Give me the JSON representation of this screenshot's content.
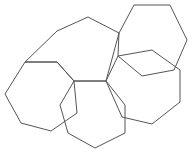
{
  "figure": {
    "name": "overlapping-heptagons-figure",
    "background_color": "#ffffff",
    "width": 195,
    "height": 154,
    "stroke_color": "#555555",
    "stroke_width": 1,
    "fill": "none",
    "shape_count": 5,
    "shape_type": "heptagon"
  },
  "chart_data": {
    "type": "diagram",
    "title": "",
    "subtitle": "",
    "xlabel": "",
    "ylabel": "",
    "grid": false,
    "legend": false,
    "xlim": [
      0,
      195
    ],
    "ylim": [
      0,
      154
    ],
    "series": [
      {
        "name": "heptagon-top-left",
        "label": "Top-left heptagon",
        "closed": true,
        "points": [
          [
            88,
            17
          ],
          [
            119,
            33
          ],
          [
            106,
            81
          ],
          [
            74,
            81
          ],
          [
            57,
            62
          ],
          [
            25,
            62
          ],
          [
            57,
            31
          ]
        ]
      },
      {
        "name": "heptagon-top-right",
        "label": "Top-right heptagon",
        "closed": true,
        "points": [
          [
            134,
            5
          ],
          [
            170,
            5
          ],
          [
            187,
            40
          ],
          [
            174,
            70
          ],
          [
            142,
            76
          ],
          [
            118,
            56
          ],
          [
            119,
            33
          ]
        ]
      },
      {
        "name": "heptagon-left",
        "label": "Left heptagon",
        "closed": true,
        "points": [
          [
            57,
            62
          ],
          [
            74,
            81
          ],
          [
            77,
            113
          ],
          [
            51,
            131
          ],
          [
            21,
            123
          ],
          [
            5,
            94
          ],
          [
            25,
            62
          ]
        ]
      },
      {
        "name": "heptagon-bottom",
        "label": "Bottom heptagon",
        "closed": true,
        "points": [
          [
            74,
            81
          ],
          [
            106,
            81
          ],
          [
            125,
            105
          ],
          [
            125,
            133
          ],
          [
            95,
            148
          ],
          [
            68,
            133
          ],
          [
            60,
            105
          ]
        ]
      },
      {
        "name": "heptagon-bottom-right",
        "label": "Bottom-right heptagon",
        "closed": true,
        "points": [
          [
            106,
            81
          ],
          [
            118,
            56
          ],
          [
            152,
            50
          ],
          [
            180,
            70
          ],
          [
            180,
            102
          ],
          [
            152,
            124
          ],
          [
            122,
            117
          ]
        ]
      }
    ]
  }
}
